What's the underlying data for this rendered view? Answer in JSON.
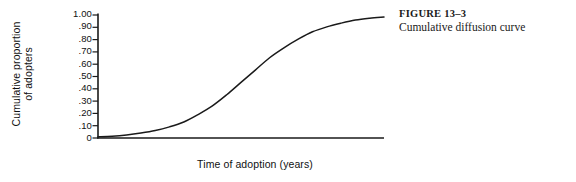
{
  "caption": {
    "number": "FIGURE 13–3",
    "text": "Cumulative diffusion curve"
  },
  "axes": {
    "y_title_line1": "Cumulative proportion",
    "y_title_line2": "of adopters",
    "x_title": "Time of adoption (years)"
  },
  "chart_data": {
    "type": "line",
    "title": "Cumulative diffusion curve",
    "xlabel": "Time of adoption (years)",
    "ylabel": "Cumulative proportion of adopters",
    "grid": false,
    "legend": "none",
    "line_color": "#1a1a1a",
    "axis_color": "#1a1a1a",
    "xlim": [
      0,
      10
    ],
    "ylim": [
      0,
      1.0
    ],
    "x_tick_labels": [],
    "y_tick_labels": [
      "1.00",
      ".90",
      ".80",
      ".70",
      ".60",
      ".50",
      ".40",
      ".30",
      ".20",
      ".10",
      "0"
    ],
    "y_tick_values": [
      1.0,
      0.9,
      0.8,
      0.7,
      0.6,
      0.5,
      0.4,
      0.3,
      0.2,
      0.1,
      0.0
    ],
    "series": [
      {
        "name": "Cumulative adopters",
        "x": [
          0.0,
          0.5,
          1.0,
          1.5,
          2.0,
          2.5,
          3.0,
          3.5,
          4.0,
          4.5,
          5.0,
          5.5,
          6.0,
          6.5,
          7.0,
          7.5,
          8.0,
          8.5,
          9.0,
          9.5,
          10.0
        ],
        "y": [
          0.01,
          0.015,
          0.025,
          0.04,
          0.06,
          0.09,
          0.13,
          0.19,
          0.26,
          0.35,
          0.45,
          0.55,
          0.65,
          0.73,
          0.8,
          0.86,
          0.9,
          0.93,
          0.955,
          0.97,
          0.98
        ]
      }
    ],
    "annotations": [
      {
        "text": "S-shaped logistic curve; inflection near 0.50"
      }
    ]
  }
}
